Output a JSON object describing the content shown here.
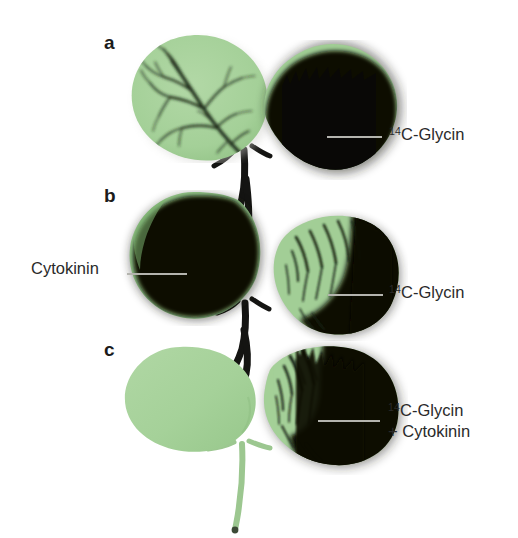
{
  "figure": {
    "background_color": "#ffffff",
    "width": 518,
    "height": 538,
    "text_color": "#2a2a2a",
    "leader_color": "#b4b4ae",
    "leaf_green": "#a6d29a",
    "leaf_green_dark": "#8ec184",
    "leaf_black": "#090806",
    "stem_black": "#121210",
    "stem_green": "#9ec992"
  },
  "panels": [
    {
      "letter": "a",
      "labels": [
        {
          "id": "a-right",
          "sup": "14",
          "text": "C-Glycin",
          "line2": ""
        }
      ]
    },
    {
      "letter": "b",
      "labels": [
        {
          "id": "b-left",
          "sup": "",
          "text": "Cytokinin",
          "line2": ""
        },
        {
          "id": "b-right",
          "sup": "14",
          "text": "C-Glycin",
          "line2": ""
        }
      ]
    },
    {
      "letter": "c",
      "labels": [
        {
          "id": "c-right",
          "sup": "14",
          "text": "C-Glycin",
          "line2": "+ Cytokinin"
        }
      ]
    }
  ],
  "labels": {
    "panel_a_letter": "a",
    "panel_b_letter": "b",
    "panel_c_letter": "c",
    "glycin_sup": "14",
    "glycin_text": "C-Glycin",
    "cytokinin_text": "Cytokinin",
    "plus_cytokinin_text": "+ Cytokinin"
  }
}
